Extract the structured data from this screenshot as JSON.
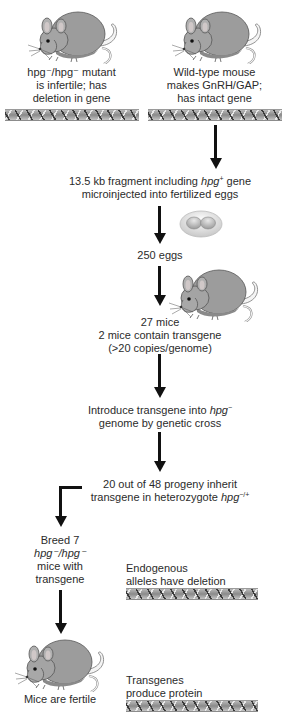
{
  "top_left": {
    "line1": "hpg⁻/hpg⁻ mutant",
    "line2": "is infertile; has",
    "line3": "deletion in gene"
  },
  "top_right": {
    "line1": "Wild-type mouse",
    "line2": "makes GnRH/GAP;",
    "line3": "has intact gene"
  },
  "step1": {
    "line1_prefix": "13.5 kb fragment including ",
    "line1_gene": "hpg",
    "line1_sup": "+",
    "line1_suffix": " gene",
    "line2": "microinjected into fertilized eggs"
  },
  "step2": {
    "label": "250 eggs"
  },
  "step3": {
    "line1": "27 mice",
    "line2": "2 mice contain transgene",
    "line3": "(>20 copies/genome)"
  },
  "step4": {
    "line1_prefix": "Introduce transgene into ",
    "line1_gene": "hpg",
    "line1_sup": "−",
    "line2": "genome by genetic cross"
  },
  "step5": {
    "line1": "20 out of 48 progeny inherit",
    "line2_prefix": "transgene in heterozygote ",
    "line2_gene": "hpg",
    "line2_sup": "−/+"
  },
  "step6": {
    "line1": "Breed 7",
    "line2_gene": "hpg⁻/hpg⁻",
    "line3": "mice with",
    "line4": "transgene"
  },
  "endogenous": {
    "line1": "Endogenous",
    "line2": "alleles have deletion"
  },
  "result": {
    "label": "Mice are fertile"
  },
  "transgenes": {
    "line1": "Transgenes",
    "line2": "produce protein"
  },
  "icons": [
    "mouse-illustration",
    "dna-helix",
    "fertilized-egg",
    "down-arrow",
    "elbow-arrow"
  ],
  "colors": {
    "mouse_body": "#9a9a9a",
    "arrow": "#111111",
    "text": "#2b2b2b"
  }
}
